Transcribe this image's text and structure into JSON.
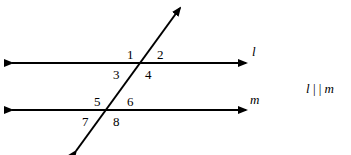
{
  "diagram": {
    "type": "parallel-lines-cut-by-transversal",
    "lines": {
      "l": {
        "label": "l"
      },
      "m": {
        "label": "m"
      }
    },
    "angles": [
      "1",
      "2",
      "3",
      "4",
      "5",
      "6",
      "7",
      "8"
    ],
    "statement": {
      "left": "l",
      "symbol": "| |",
      "right": "m"
    }
  }
}
